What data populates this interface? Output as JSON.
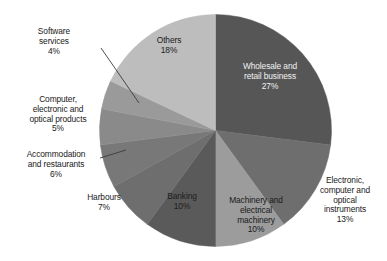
{
  "chart_data": {
    "type": "pie",
    "title": "",
    "subtitle": "",
    "xlabel": "",
    "ylabel": "",
    "legend": "none",
    "grid": false,
    "units": "percent",
    "start_angle_deg": 0,
    "direction": "clockwise",
    "categories": [
      "Wholesale and retail business",
      "Electronic, computer and optical instruments",
      "Machinery and electrical machinery",
      "Banking",
      "Harbours",
      "Accommodation and restaurants",
      "Computer, electronic and optical products",
      "Software services",
      "Others"
    ],
    "values": [
      27,
      13,
      10,
      10,
      7,
      6,
      5,
      4,
      18
    ],
    "colors": [
      "#565656",
      "#6e6e6e",
      "#9c9c9c",
      "#5a5a5a",
      "#6e6e6e",
      "#787878",
      "#8a8a8a",
      "#9a9a9a",
      "#bdbdbd"
    ],
    "slices": [
      {
        "label": "Wholesale and retail business",
        "value": 27,
        "value_label": "27%",
        "color": "#565656",
        "label_text": "Wholesale and\nretail business\n27%",
        "label_placement": "inside",
        "label_color": "#f2f2f2",
        "leader_line": false
      },
      {
        "label": "Electronic, computer and optical instruments",
        "value": 13,
        "value_label": "13%",
        "color": "#6e6e6e",
        "label_text": "Electronic,\ncomputer and\noptical\ninstruments\n13%",
        "label_placement": "outside",
        "label_color": "#1a1a1a",
        "leader_line": false
      },
      {
        "label": "Machinery and electrical machinery",
        "value": 10,
        "value_label": "10%",
        "color": "#9c9c9c",
        "label_text": "Machinery and\nelectrical\nmachinery\n10%",
        "label_placement": "outside",
        "label_color": "#1a1a1a",
        "leader_line": false
      },
      {
        "label": "Banking",
        "value": 10,
        "value_label": "10%",
        "color": "#5a5a5a",
        "label_text": "Banking\n10%",
        "label_placement": "inside",
        "label_color": "#1c1c1c",
        "leader_line": false
      },
      {
        "label": "Harbours",
        "value": 7,
        "value_label": "7%",
        "color": "#6e6e6e",
        "label_text": "Harbours\n7%",
        "label_placement": "outside",
        "label_color": "#1a1a1a",
        "leader_line": false
      },
      {
        "label": "Accommodation and restaurants",
        "value": 6,
        "value_label": "6%",
        "color": "#787878",
        "label_text": "Accommodation\nand restaurants\n6%",
        "label_placement": "outside",
        "label_color": "#1a1a1a",
        "leader_line": true
      },
      {
        "label": "Computer, electronic and optical products",
        "value": 5,
        "value_label": "5%",
        "color": "#8a8a8a",
        "label_text": "Computer,\nelectronic and\noptical products\n5%",
        "label_placement": "outside",
        "label_color": "#1a1a1a",
        "leader_line": false
      },
      {
        "label": "Software services",
        "value": 4,
        "value_label": "4%",
        "color": "#9a9a9a",
        "label_text": "Software\nservices\n4%",
        "label_placement": "outside",
        "label_color": "#1a1a1a",
        "leader_line": true
      },
      {
        "label": "Others",
        "value": 18,
        "value_label": "18%",
        "color": "#bdbdbd",
        "label_text": "Others\n18%",
        "label_placement": "inside",
        "label_color": "#1c1c1c",
        "leader_line": false
      }
    ]
  },
  "labels": {
    "wholesale": "Wholesale and\nretail business\n27%",
    "electronic_instruments": "Electronic,\ncomputer and\noptical\ninstruments\n13%",
    "machinery": "Machinery and\nelectrical\nmachinery\n10%",
    "banking": "Banking\n10%",
    "harbours": "Harbours\n7%",
    "accommodation": "Accommodation\nand restaurants\n6%",
    "computer_products": "Computer,\nelectronic and\noptical products\n5%",
    "software_services": "Software\nservices\n4%",
    "others": "Others\n18%"
  }
}
